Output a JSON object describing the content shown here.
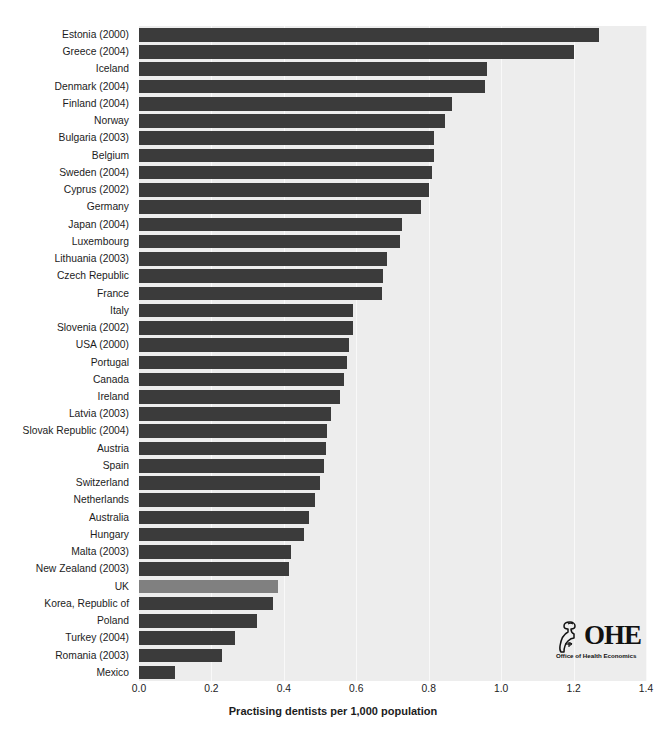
{
  "chart_data": {
    "type": "bar",
    "orientation": "horizontal",
    "title": "",
    "xlabel": "Practising dentists per 1,000 population",
    "ylabel": "",
    "xlim": [
      0.0,
      1.4
    ],
    "xticks": [
      "0.0",
      "0.2",
      "0.4",
      "0.6",
      "0.8",
      "1.0",
      "1.2",
      "1.4"
    ],
    "xtick_values": [
      0.0,
      0.2,
      0.4,
      0.6,
      0.8,
      1.0,
      1.2,
      1.4
    ],
    "grid": true,
    "legend": "none",
    "categories": [
      "Estonia (2000)",
      "Greece (2004)",
      "Iceland",
      "Denmark (2004)",
      "Finland (2004)",
      "Norway",
      "Bulgaria (2003)",
      "Belgium",
      "Sweden (2004)",
      "Cyprus (2002)",
      "Germany",
      "Japan (2004)",
      "Luxembourg",
      "Lithuania (2003)",
      "Czech Republic",
      "France",
      "Italy",
      "Slovenia (2002)",
      "USA (2000)",
      "Portugal",
      "Canada",
      "Ireland",
      "Latvia (2003)",
      "Slovak Republic (2004)",
      "Austria",
      "Spain",
      "Switzerland",
      "Netherlands",
      "Australia",
      "Hungary",
      "Malta (2003)",
      "New Zealand (2003)",
      "UK",
      "Korea, Republic of",
      "Poland",
      "Turkey (2004)",
      "Romania (2003)",
      "Mexico"
    ],
    "values": [
      1.27,
      1.2,
      0.96,
      0.955,
      0.865,
      0.845,
      0.815,
      0.815,
      0.81,
      0.8,
      0.78,
      0.725,
      0.72,
      0.685,
      0.675,
      0.67,
      0.59,
      0.59,
      0.58,
      0.575,
      0.565,
      0.555,
      0.53,
      0.52,
      0.515,
      0.51,
      0.5,
      0.485,
      0.47,
      0.455,
      0.42,
      0.415,
      0.385,
      0.37,
      0.325,
      0.265,
      0.23,
      0.1
    ],
    "highlight_category": "UK",
    "colors": {
      "bar": "#3b3b3b",
      "bar_highlight": "#808080",
      "plot_background": "#ededed",
      "gridline": "#f9f9f9",
      "text": "#1c1c1c",
      "page_background": "#ffffff"
    }
  },
  "logo": {
    "wordmark": "OHE",
    "tagline": "Office of Health Economics",
    "mark_name": "tooth-and-pillar-icon"
  }
}
